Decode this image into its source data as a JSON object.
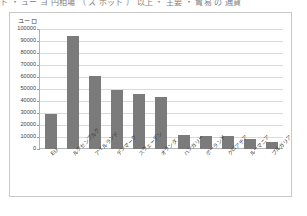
{
  "page": {
    "clipped_header_text": "ト ・ ュー ヨ 円相場 （ ス ポット ） 以上 ・ 主要 ・ 貿易 の 通貨"
  },
  "chart_data": {
    "type": "bar",
    "title": "",
    "subtitle": "",
    "xlabel": "",
    "ylabel": "ユーロ",
    "ylim": [
      0,
      100000
    ],
    "ytick_labels": [
      "100000",
      "90000",
      "80000",
      "70000",
      "60000",
      "50000",
      "40000",
      "30000",
      "20000",
      "10000",
      "0"
    ],
    "ytick_values": [
      100000,
      90000,
      80000,
      70000,
      60000,
      50000,
      40000,
      30000,
      20000,
      10000,
      0
    ],
    "grid": true,
    "legend": "none",
    "bar_color": "#7b7b7b",
    "gridline_color": "#d9d9d9",
    "axis_color": "#b3b3b3",
    "categories": [
      "EU",
      "ルクセンブルク",
      "アイルランド",
      "デンマーク",
      "スウェーデン",
      "オランダ",
      "ハンガリー",
      "ポーランド",
      "クロアチア",
      "ルーマニア",
      "ブルガリア"
    ],
    "values": [
      29500,
      94000,
      61000,
      49500,
      46000,
      43500,
      11600,
      11200,
      10700,
      8200,
      6000
    ]
  }
}
